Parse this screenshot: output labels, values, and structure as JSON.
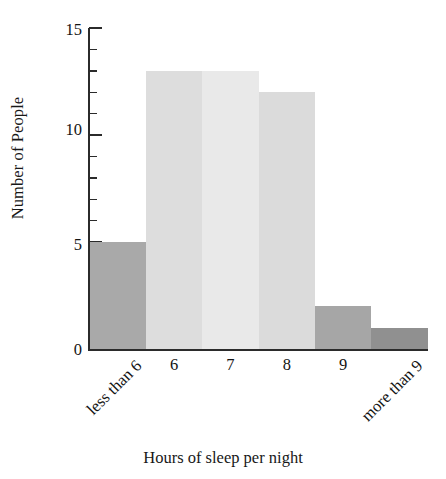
{
  "chart_data": {
    "type": "bar",
    "title": "",
    "xlabel": "Hours of sleep per night",
    "ylabel": "Number of People",
    "categories": [
      "less than 6",
      "6",
      "7",
      "8",
      "9",
      "more than 9"
    ],
    "values": [
      5,
      13,
      13,
      12,
      2,
      1
    ],
    "ylim": [
      0,
      15
    ],
    "ytick_labels": [
      "0",
      "5",
      "10",
      "15"
    ],
    "ytick_values": [
      0,
      5,
      10,
      15
    ],
    "minor_tick_step": 1,
    "grid": false,
    "legend": null,
    "bar_colors": [
      "#a9a9a9",
      "#dddddd",
      "#e9e9e9",
      "#dbdbdb",
      "#a6a6a6",
      "#909090"
    ],
    "bar_gap": 0,
    "axis_color": "#2b2b2b",
    "text_color": "#141414",
    "background": "#ffffff",
    "rotated_labels": [
      "less than 6",
      "more than 9"
    ]
  },
  "axis": {
    "y_title": "Number of People",
    "x_title": "Hours of sleep per night"
  }
}
